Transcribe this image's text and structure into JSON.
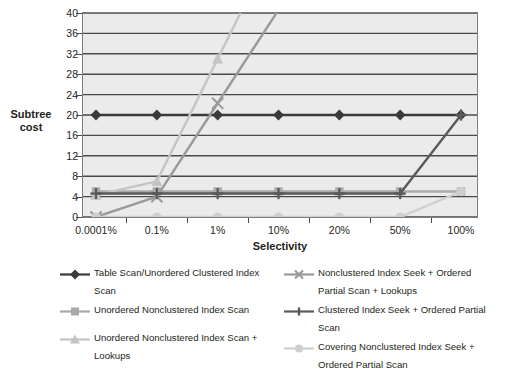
{
  "axes": {
    "y_title": "Subtree cost",
    "y_title_line1": "Subtree",
    "y_title_line2": "cost",
    "x_title": "Selectivity"
  },
  "chart_data": {
    "type": "line",
    "title": "",
    "xlabel": "Selectivity",
    "ylabel": "Subtree cost",
    "categories": [
      "0.0001%",
      "0.1%",
      "1%",
      "10%",
      "20%",
      "50%",
      "100%"
    ],
    "ylim": [
      0,
      40
    ],
    "ytick_labels": [
      "0",
      "4",
      "8",
      "12",
      "16",
      "20",
      "24",
      "28",
      "32",
      "36",
      "40"
    ],
    "ytick_values": [
      0,
      4,
      8,
      12,
      16,
      20,
      24,
      28,
      32,
      36,
      40
    ],
    "grid": true,
    "legend_position": "bottom",
    "series": [
      {
        "name": "Table Scan/Unordered Clustered Index Scan",
        "marker": "diamond",
        "color": "#3a3a3a",
        "values": [
          20,
          20,
          20,
          20,
          20,
          20,
          20
        ]
      },
      {
        "name": "Unordered Nonclustered Index Scan",
        "marker": "square",
        "color": "#a9a9a9",
        "values": [
          5,
          5,
          5,
          5,
          5,
          5,
          5
        ]
      },
      {
        "name": "Unordered Nonclustered Index Scan + Lookups",
        "marker": "triangle",
        "color": "#c4c4c4",
        "values": [
          4.3,
          7,
          31,
          null,
          null,
          null,
          null
        ]
      },
      {
        "name": "Nonclustered Index Seek + Ordered Partial Scan + Lookups",
        "marker": "x",
        "color": "#9a9a9a",
        "values": [
          0,
          4,
          22.3,
          null,
          null,
          null,
          null
        ]
      },
      {
        "name": "Clustered Index Seek + Ordered Partial Scan",
        "marker": "plus",
        "color": "#5a5a5a",
        "values": [
          4.6,
          4.6,
          4.6,
          4.6,
          4.6,
          4.6,
          20
        ]
      },
      {
        "name": "Covering Nonclustered Index Seek + Ordered Partial Scan",
        "marker": "circle",
        "color": "#cfcfcf",
        "values": [
          0,
          0,
          0,
          0,
          0,
          0,
          5
        ]
      }
    ]
  },
  "legend": {
    "left_column": [
      {
        "label": "Table Scan/Unordered Clustered Index Scan",
        "marker": "diamond",
        "color": "#3a3a3a",
        "name": "legend-item-table-scan"
      },
      {
        "label": "Unordered Nonclustered Index Scan",
        "marker": "square",
        "color": "#a9a9a9",
        "name": "legend-item-unordered-nonclustered-index-scan"
      },
      {
        "label": "Unordered Nonclustered Index Scan + Lookups",
        "marker": "triangle",
        "color": "#c4c4c4",
        "name": "legend-item-unordered-nonclustered-index-scan-lookups"
      }
    ],
    "right_column": [
      {
        "label": "Nonclustered Index Seek + Ordered Partial Scan + Lookups",
        "marker": "x",
        "color": "#9a9a9a",
        "name": "legend-item-nonclustered-index-seek-lookups"
      },
      {
        "label": "Clustered Index Seek + Ordered Partial Scan",
        "marker": "plus",
        "color": "#5a5a5a",
        "name": "legend-item-clustered-index-seek"
      },
      {
        "label": "Covering Nonclustered Index Seek + Ordered Partial Scan",
        "marker": "circle",
        "color": "#cfcfcf",
        "name": "legend-item-covering-nonclustered-index-seek"
      }
    ]
  },
  "colors": {
    "plot_background": "#ebebeb",
    "gridline": "#4a4a4a",
    "frame": "#7d7d7d",
    "text": "#231f20"
  }
}
